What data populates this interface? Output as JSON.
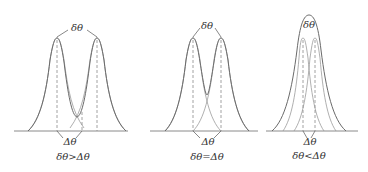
{
  "figure": {
    "panels": [
      {
        "id": "resolved",
        "peak_sep_label": "δθ",
        "width_label": "Δθ",
        "caption": "δθ>Δθ"
      },
      {
        "id": "rayleigh-limit",
        "peak_sep_label": "δθ",
        "width_label": "Δθ",
        "caption": "δθ=Δθ"
      },
      {
        "id": "unresolved",
        "peak_sep_label": "δθ",
        "width_label": "Δθ",
        "caption": "δθ<Δθ"
      }
    ],
    "colors": {
      "curve": "#6a6a6a",
      "dashed": "#8a8a8a",
      "text": "#333333"
    }
  }
}
